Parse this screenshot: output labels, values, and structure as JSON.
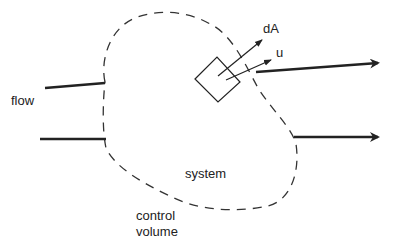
{
  "diagram": {
    "type": "control-volume-schematic",
    "labels": {
      "flow": "flow",
      "dA": "dA",
      "u": "u",
      "system": "system",
      "control_volume_line1": "control",
      "control_volume_line2": "volume"
    },
    "elements": {
      "control_volume_boundary": "dashed closed curve",
      "inflow_lines": 2,
      "outflow_arrows": 2,
      "surface_element": "square patch with normal vector dA and velocity vector u"
    },
    "colors": {
      "stroke": "#222222",
      "text": "#222222",
      "background": "#ffffff"
    }
  }
}
